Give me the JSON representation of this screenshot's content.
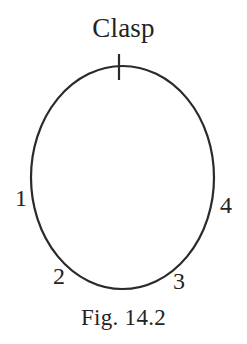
{
  "figure": {
    "title": "Clasp",
    "caption": "Fig. 14.2",
    "background_color": "#ffffff",
    "ink_color": "#2a2a2a",
    "shape": {
      "name": "necklace-oval",
      "type": "ellipse",
      "center_x": 122.5,
      "center_y": 177.5,
      "radius_x": 91.5,
      "radius_y": 111.5,
      "stroke_width": 2.2
    },
    "clasp_mark": {
      "name": "clasp-tick",
      "type": "line",
      "x": 119,
      "y_top": 54,
      "y_bottom": 80,
      "stroke_width": 2.2
    },
    "point_labels": [
      {
        "id": "1",
        "text": "1",
        "position": "left"
      },
      {
        "id": "2",
        "text": "2",
        "position": "lower-left"
      },
      {
        "id": "3",
        "text": "3",
        "position": "lower-right"
      },
      {
        "id": "4",
        "text": "4",
        "position": "right"
      }
    ]
  }
}
